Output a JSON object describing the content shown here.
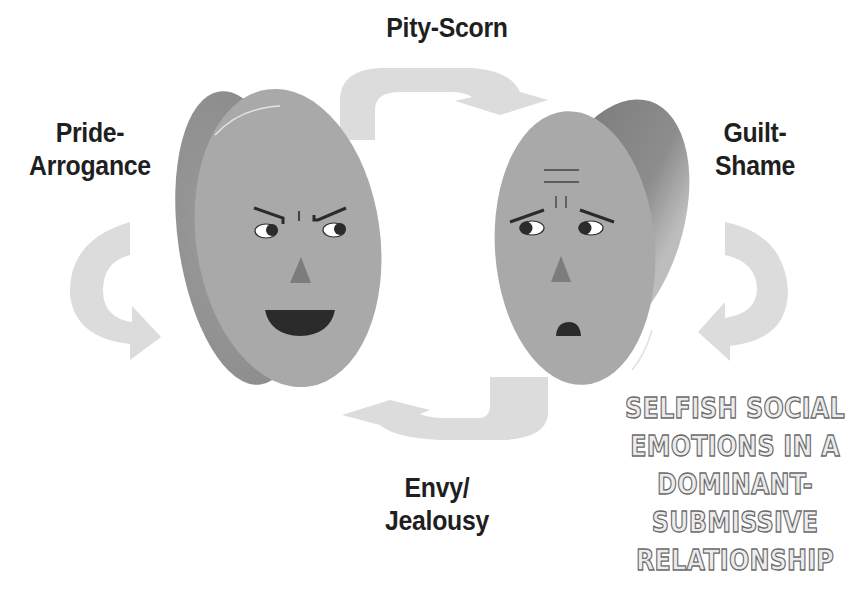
{
  "diagram": {
    "title_block": {
      "lines": [
        "SELFISH SOCIAL",
        "EMOTIONS IN A",
        "DOMINANT-",
        "SUBMISSIVE",
        "RELATIONSHIP"
      ]
    },
    "labels": {
      "top": {
        "lines": [
          "Pity-Scorn"
        ]
      },
      "left": {
        "lines": [
          "Pride-",
          "Arrogance"
        ]
      },
      "right": {
        "lines": [
          "Guilt-",
          "Shame"
        ]
      },
      "bottom": {
        "lines": [
          "Envy/",
          "Jealousy"
        ]
      }
    },
    "faces": [
      {
        "id": "dominant",
        "expression": "arrogant-grin",
        "position": "left"
      },
      {
        "id": "submissive",
        "expression": "worried-ashamed",
        "position": "right"
      }
    ],
    "arrows": [
      {
        "id": "top",
        "direction": "left-to-right",
        "shape": "curved-over"
      },
      {
        "id": "bottom",
        "direction": "right-to-left",
        "shape": "curved-under"
      },
      {
        "id": "left",
        "direction": "clockwise-loop",
        "shape": "c-curve"
      },
      {
        "id": "right",
        "direction": "counterclockwise-loop",
        "shape": "reverse-c-curve"
      }
    ],
    "colors": {
      "face": "#a8a8a8",
      "face_edge": "#8c8c8c",
      "arrow": "#dcdcdc",
      "features": "#2b2b2b",
      "nose": "#7c7c7c",
      "text": "#1f1f1f"
    }
  }
}
